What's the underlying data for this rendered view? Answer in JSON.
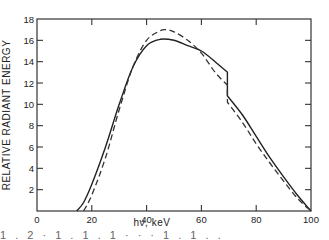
{
  "chart_data": {
    "type": "line",
    "title": "",
    "xlabel": "hν, keV",
    "ylabel": "RELATIVE RADIANT ENERGY",
    "xlim": [
      0,
      100
    ],
    "ylim": [
      0,
      18
    ],
    "x_ticks": [
      0,
      20,
      40,
      60,
      80,
      100
    ],
    "y_ticks": [
      2,
      4,
      6,
      8,
      10,
      12,
      14,
      16,
      18
    ],
    "grid": false,
    "legend": null,
    "series": [
      {
        "name": "solid",
        "style": "solid",
        "points": [
          [
            14.5,
            0
          ],
          [
            17,
            0.8
          ],
          [
            20,
            2.5
          ],
          [
            25,
            6
          ],
          [
            30,
            10
          ],
          [
            35,
            13.5
          ],
          [
            40,
            15.5
          ],
          [
            45,
            16.1
          ],
          [
            50,
            16.0
          ],
          [
            55,
            15.5
          ],
          [
            60,
            15.0
          ],
          [
            65,
            14.0
          ],
          [
            69.5,
            13.0
          ],
          [
            69.5,
            10.8
          ],
          [
            75,
            9.0
          ],
          [
            80,
            7.0
          ],
          [
            85,
            5.0
          ],
          [
            90,
            3.2
          ],
          [
            95,
            1.5
          ],
          [
            100,
            0
          ]
        ]
      },
      {
        "name": "dashed",
        "style": "dashed",
        "points": [
          [
            17,
            0
          ],
          [
            20,
            1.5
          ],
          [
            25,
            5
          ],
          [
            30,
            9.5
          ],
          [
            35,
            13.5
          ],
          [
            40,
            16.0
          ],
          [
            45,
            16.9
          ],
          [
            47,
            17.0
          ],
          [
            50,
            16.8
          ],
          [
            55,
            16.0
          ],
          [
            60,
            14.8
          ],
          [
            65,
            13.0
          ],
          [
            69.5,
            11.8
          ],
          [
            69.5,
            10.2
          ],
          [
            75,
            8.3
          ],
          [
            80,
            6.3
          ],
          [
            85,
            4.5
          ],
          [
            90,
            2.8
          ],
          [
            95,
            1.2
          ],
          [
            100,
            0
          ]
        ]
      }
    ],
    "annotations": [
      "Discontinuity (K-edge step) near 69.5 keV in both curves"
    ]
  },
  "layout": {
    "plot_left": 37,
    "plot_right": 311,
    "plot_top": 19,
    "plot_bottom": 211
  },
  "labels": {
    "x_axis_title": "hν, keV",
    "y_axis_title": "RELATIVE RADIANT ENERGY",
    "x_tick_labels": [
      "0",
      "20",
      "40",
      "60",
      "80",
      "100"
    ],
    "y_tick_labels": [
      "2",
      "4",
      "6",
      "8",
      "10",
      "12",
      "14",
      "16",
      "18"
    ]
  },
  "caption_fragment": "1 . 2   ·   1   .   1 .   1   ·   ·   ·   1   .   1 .   ."
}
